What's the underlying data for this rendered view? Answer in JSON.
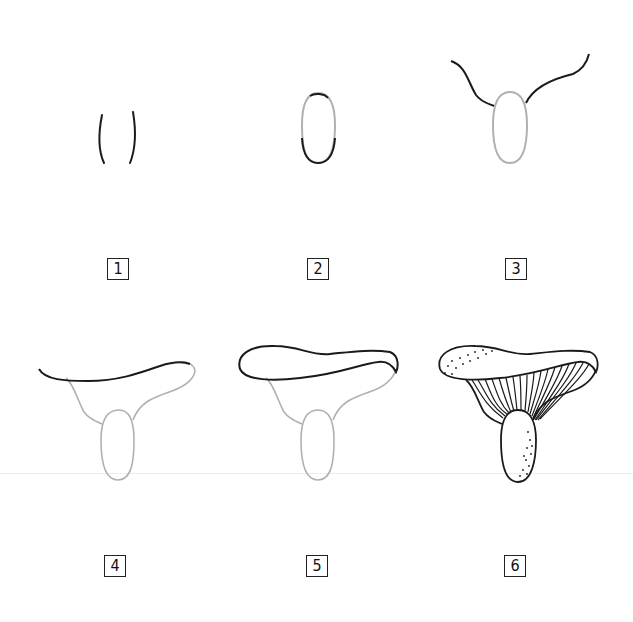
{
  "figure": {
    "colors": {
      "ink": "#1a1a1a",
      "guide": "#a8a8a8",
      "background": "#ffffff"
    },
    "steps": [
      {
        "number": "1",
        "description": "Two curved vertical lines for the stem"
      },
      {
        "number": "2",
        "description": "Close the stem into an oval"
      },
      {
        "number": "3",
        "description": "Wavy lines extending outward from top of stem for cap underside"
      },
      {
        "number": "4",
        "description": "Cap top edge curve"
      },
      {
        "number": "5",
        "description": "Closed wavy cap rim"
      },
      {
        "number": "6",
        "description": "Finished mushroom with gills and stippling"
      }
    ]
  }
}
